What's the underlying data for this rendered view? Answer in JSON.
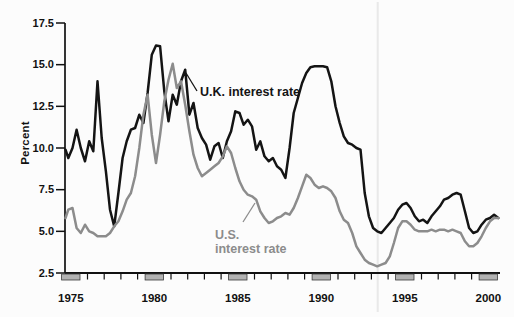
{
  "figure": {
    "background_color": "#fcfcfc",
    "scan_artifact_line_color": "#e9e9e9"
  },
  "chart_data": {
    "type": "line",
    "title": "",
    "xlabel": "",
    "ylabel": "Percent",
    "grid": false,
    "legend": "inline-annotations",
    "x_start": 1974.6,
    "x_step": 0.25,
    "x_axis": {
      "range": [
        1974.5,
        2000.8
      ],
      "tick_years": [
        1975,
        1980,
        1985,
        1990,
        1995,
        2000
      ],
      "tick_labels": [
        "1975",
        "1980",
        "1985",
        "1990",
        "1995",
        "2000"
      ],
      "minor_tick_interval_years": 1,
      "tick_block_fill": "#b2b2b2",
      "tick_block_edge": "#3a3a3a"
    },
    "y_axis": {
      "range": [
        2.5,
        17.5
      ],
      "ticks": [
        {
          "value": 17.5,
          "label": "17.5"
        },
        {
          "value": 15.0,
          "label": "15.0"
        },
        {
          "value": 12.5,
          "label": "12.5"
        },
        {
          "value": 10.0,
          "label": "10.0"
        },
        {
          "value": 7.5,
          "label": "7.5"
        },
        {
          "value": 5.0,
          "label": "5.0"
        },
        {
          "value": 2.5,
          "label": "2.5"
        }
      ]
    },
    "series": [
      {
        "name": "U.K. interest rate",
        "color": "#141414",
        "values": [
          9.9,
          9.4,
          10.0,
          11.1,
          10.0,
          9.2,
          10.4,
          9.8,
          14.0,
          10.6,
          8.6,
          6.3,
          5.3,
          7.3,
          9.4,
          10.4,
          11.1,
          11.2,
          12.0,
          11.5,
          13.3,
          15.6,
          16.15,
          16.1,
          13.4,
          11.6,
          13.2,
          12.6,
          14.0,
          14.7,
          12.0,
          12.7,
          11.2,
          10.6,
          10.2,
          9.3,
          10.1,
          10.3,
          9.4,
          10.4,
          11.0,
          12.2,
          12.1,
          11.4,
          11.7,
          11.3,
          9.9,
          10.4,
          9.5,
          9.2,
          9.4,
          8.9,
          8.7,
          8.2,
          10.0,
          12.1,
          13.0,
          13.9,
          14.5,
          14.85,
          14.9,
          14.9,
          14.9,
          14.85,
          14.0,
          12.5,
          11.5,
          10.7,
          10.3,
          10.2,
          10.0,
          9.9,
          7.3,
          5.9,
          5.2,
          5.0,
          4.9,
          5.2,
          5.5,
          5.8,
          6.3,
          6.6,
          6.7,
          6.4,
          5.9,
          5.6,
          5.7,
          5.5,
          5.9,
          6.2,
          6.5,
          6.9,
          7.0,
          7.2,
          7.3,
          7.2,
          6.2,
          5.2,
          4.9,
          5.0,
          5.4,
          5.7,
          5.8,
          6.0,
          5.8
        ]
      },
      {
        "name": "U.S. interest rate",
        "color": "#8c8c8c",
        "values": [
          5.8,
          6.3,
          6.4,
          5.2,
          4.9,
          5.4,
          5.0,
          4.9,
          4.7,
          4.7,
          4.7,
          4.9,
          5.3,
          5.6,
          6.2,
          6.9,
          7.3,
          8.3,
          10.0,
          12.0,
          13.2,
          10.8,
          9.1,
          10.8,
          12.8,
          14.1,
          15.05,
          13.6,
          14.0,
          12.6,
          11.0,
          9.6,
          8.8,
          8.3,
          8.5,
          8.7,
          8.9,
          9.1,
          9.5,
          10.1,
          9.7,
          8.8,
          8.0,
          7.5,
          7.2,
          7.1,
          6.9,
          6.2,
          5.8,
          5.5,
          5.6,
          5.8,
          5.9,
          6.1,
          6.0,
          6.4,
          7.0,
          7.7,
          8.4,
          8.2,
          7.8,
          7.6,
          7.7,
          7.6,
          7.4,
          7.0,
          6.2,
          5.7,
          5.5,
          4.9,
          4.1,
          3.7,
          3.3,
          3.1,
          3.0,
          2.9,
          3.0,
          3.1,
          3.5,
          4.3,
          5.2,
          5.6,
          5.6,
          5.4,
          5.1,
          5.0,
          5.0,
          5.0,
          5.1,
          5.0,
          5.1,
          5.1,
          5.0,
          5.1,
          5.0,
          4.9,
          4.4,
          4.1,
          4.1,
          4.3,
          4.7,
          5.2,
          5.6,
          5.8,
          5.8
        ]
      }
    ],
    "annotations": [
      {
        "id": "uk-label",
        "text": "U.K. interest rate",
        "color": "#141414"
      },
      {
        "id": "us-label",
        "text_lines": [
          "U.S.",
          "interest rate"
        ],
        "color": "#8c8c8c"
      }
    ]
  }
}
